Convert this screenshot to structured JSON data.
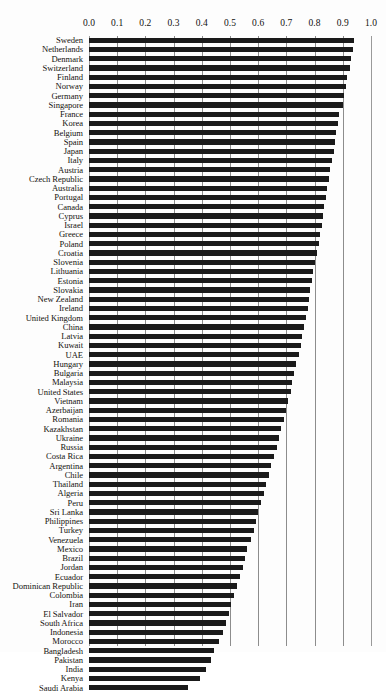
{
  "chart_data": {
    "type": "bar",
    "orientation": "horizontal",
    "title": "",
    "xlabel": "",
    "ylabel": "",
    "xlim": [
      0.0,
      1.0
    ],
    "grid": true,
    "legend": "none",
    "xticks": [
      "0.0",
      "0.1",
      "0.2",
      "0.3",
      "0.4",
      "0.5",
      "0.6",
      "0.7",
      "0.8",
      "0.9",
      "1.0"
    ],
    "xtick_values": [
      0.0,
      0.1,
      0.2,
      0.3,
      0.4,
      0.5,
      0.6,
      0.7,
      0.8,
      0.9,
      1.0
    ],
    "categories": [
      "Sweden",
      "Netherlands",
      "Denmark",
      "Switzerland",
      "Finland",
      "Norway",
      "Germany",
      "Singapore",
      "France",
      "Korea",
      "Belgium",
      "Spain",
      "Japan",
      "Italy",
      "Austria",
      "Czech Republic",
      "Australia",
      "Portugal",
      "Canada",
      "Cyprus",
      "Israel",
      "Greece",
      "Poland",
      "Croatia",
      "Slovenia",
      "Lithuania",
      "Estonia",
      "Slovakia",
      "New Zealand",
      "Ireland",
      "United Kingdom",
      "China",
      "Latvia",
      "Kuwait",
      "UAE",
      "Hungary",
      "Bulgaria",
      "Malaysia",
      "United States",
      "Vietnam",
      "Azerbaijan",
      "Romania",
      "Kazakhstan",
      "Ukraine",
      "Russia",
      "Costa Rica",
      "Argentina",
      "Chile",
      "Thailand",
      "Algeria",
      "Peru",
      "Sri Lanka",
      "Philippines",
      "Turkey",
      "Venezuela",
      "Mexico",
      "Brazil",
      "Jordan",
      "Ecuador",
      "Dominican Republic",
      "Colombia",
      "Iran",
      "El Salvador",
      "South Africa",
      "Indonesia",
      "Morocco",
      "Bangladesh",
      "Pakistan",
      "India",
      "Kenya",
      "Saudi Arabia"
    ],
    "values": [
      0.94,
      0.935,
      0.93,
      0.925,
      0.915,
      0.912,
      0.905,
      0.9,
      0.885,
      0.882,
      0.875,
      0.872,
      0.868,
      0.862,
      0.855,
      0.85,
      0.845,
      0.84,
      0.835,
      0.83,
      0.825,
      0.82,
      0.815,
      0.808,
      0.8,
      0.795,
      0.79,
      0.785,
      0.78,
      0.775,
      0.77,
      0.762,
      0.755,
      0.75,
      0.745,
      0.735,
      0.728,
      0.72,
      0.715,
      0.705,
      0.698,
      0.69,
      0.682,
      0.675,
      0.668,
      0.655,
      0.645,
      0.638,
      0.628,
      0.62,
      0.61,
      0.6,
      0.592,
      0.585,
      0.575,
      0.562,
      0.552,
      0.545,
      0.535,
      0.525,
      0.515,
      0.505,
      0.495,
      0.485,
      0.475,
      0.46,
      0.445,
      0.432,
      0.415,
      0.395,
      0.35
    ],
    "bar_color": "#1a1a1a"
  }
}
